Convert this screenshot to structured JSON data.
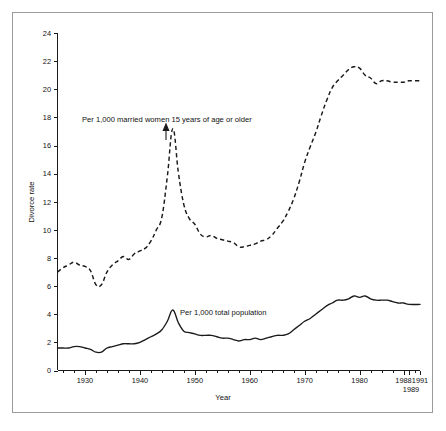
{
  "figure": {
    "background_color": "#ffffff",
    "frame_color": "#9a9a9a",
    "ink_color": "#1a1a1a"
  },
  "labels": {
    "y_axis_title": "Divorce rate",
    "x_axis_title": "Year",
    "series_married_women": "Per 1,000 married women 15 years of age or older",
    "series_total_population": "Per 1,000 total population",
    "x_tick_1988": "1988",
    "x_tick_1989": "1989",
    "x_tick_1991": "1991"
  },
  "chart_data": {
    "type": "line",
    "title": "",
    "xlabel": "Year",
    "ylabel": "Divorce rate",
    "xlim": [
      1925,
      1991
    ],
    "ylim": [
      0,
      24
    ],
    "grid": false,
    "legend_position": "inline-annotation",
    "ytick_labels": [
      "0",
      "2",
      "4",
      "6",
      "8",
      "10",
      "12",
      "14",
      "16",
      "18",
      "20",
      "22",
      "24"
    ],
    "yticks": [
      0,
      2,
      4,
      6,
      8,
      10,
      12,
      14,
      16,
      18,
      20,
      22,
      24
    ],
    "xtick_labels": [
      "1930",
      "1940",
      "1950",
      "1960",
      "1970",
      "1980",
      "1988",
      "1989",
      "1991"
    ],
    "xticks": [
      1930,
      1940,
      1950,
      1960,
      1970,
      1980,
      1988,
      1989,
      1991
    ],
    "annotations": [
      {
        "text": "Per 1,000 married women 15 years of age or older",
        "points_to_year": 1946,
        "points_to_value": 17.2
      },
      {
        "text": "Per 1,000 total population",
        "points_to_year": 1946,
        "points_to_value": 4.3
      }
    ],
    "series": [
      {
        "name": "Per 1,000 married women 15 years of age or older",
        "style": "dashed",
        "x": [
          1925,
          1926,
          1927,
          1928,
          1929,
          1930,
          1931,
          1932,
          1933,
          1934,
          1935,
          1936,
          1937,
          1938,
          1939,
          1940,
          1941,
          1942,
          1943,
          1944,
          1945,
          1946,
          1947,
          1948,
          1949,
          1950,
          1951,
          1952,
          1953,
          1954,
          1955,
          1956,
          1957,
          1958,
          1959,
          1960,
          1961,
          1962,
          1963,
          1964,
          1965,
          1966,
          1967,
          1968,
          1969,
          1970,
          1971,
          1972,
          1973,
          1974,
          1975,
          1976,
          1977,
          1978,
          1979,
          1980,
          1981,
          1982,
          1983,
          1984,
          1985,
          1986,
          1987,
          1988,
          1989,
          1991
        ],
        "values": [
          7.0,
          7.3,
          7.5,
          7.7,
          7.5,
          7.4,
          7.1,
          6.1,
          6.1,
          7.0,
          7.5,
          7.8,
          8.1,
          7.9,
          8.3,
          8.5,
          8.7,
          9.2,
          10.0,
          10.9,
          13.8,
          17.2,
          14.1,
          11.8,
          10.8,
          10.4,
          9.7,
          9.5,
          9.6,
          9.4,
          9.3,
          9.2,
          9.1,
          8.8,
          8.8,
          8.9,
          9.0,
          9.2,
          9.3,
          9.6,
          10.1,
          10.6,
          11.3,
          12.2,
          13.4,
          14.8,
          15.9,
          16.9,
          18.1,
          19.2,
          20.1,
          20.6,
          21.0,
          21.4,
          21.6,
          21.5,
          21.0,
          20.8,
          20.4,
          20.6,
          20.6,
          20.5,
          20.5,
          20.5,
          20.6,
          20.6
        ]
      },
      {
        "name": "Per 1,000 total population",
        "style": "solid",
        "x": [
          1925,
          1926,
          1927,
          1928,
          1929,
          1930,
          1931,
          1932,
          1933,
          1934,
          1935,
          1936,
          1937,
          1938,
          1939,
          1940,
          1941,
          1942,
          1943,
          1944,
          1945,
          1946,
          1947,
          1948,
          1949,
          1950,
          1951,
          1952,
          1953,
          1954,
          1955,
          1956,
          1957,
          1958,
          1959,
          1960,
          1961,
          1962,
          1963,
          1964,
          1965,
          1966,
          1967,
          1968,
          1969,
          1970,
          1971,
          1972,
          1973,
          1974,
          1975,
          1976,
          1977,
          1978,
          1979,
          1980,
          1981,
          1982,
          1983,
          1984,
          1985,
          1986,
          1987,
          1988,
          1989,
          1991
        ],
        "values": [
          1.6,
          1.6,
          1.6,
          1.7,
          1.7,
          1.6,
          1.5,
          1.3,
          1.3,
          1.6,
          1.7,
          1.8,
          1.9,
          1.9,
          1.9,
          2.0,
          2.2,
          2.4,
          2.6,
          2.9,
          3.5,
          4.3,
          3.4,
          2.8,
          2.7,
          2.6,
          2.5,
          2.5,
          2.5,
          2.4,
          2.3,
          2.3,
          2.2,
          2.1,
          2.2,
          2.2,
          2.3,
          2.2,
          2.3,
          2.4,
          2.5,
          2.5,
          2.6,
          2.9,
          3.2,
          3.5,
          3.7,
          4.0,
          4.3,
          4.6,
          4.8,
          5.0,
          5.0,
          5.1,
          5.3,
          5.2,
          5.3,
          5.1,
          5.0,
          5.0,
          5.0,
          4.9,
          4.8,
          4.8,
          4.7,
          4.7
        ]
      }
    ]
  }
}
